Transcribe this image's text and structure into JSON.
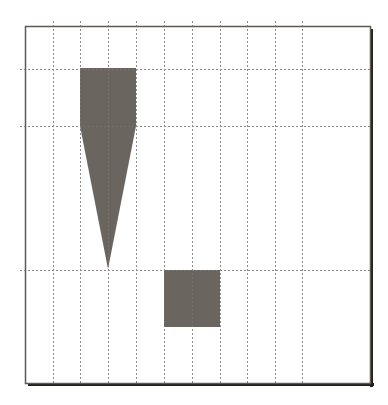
{
  "diagram": {
    "canvas": {
      "width": 388,
      "height": 405
    },
    "frame": {
      "x": 25,
      "y": 26,
      "width": 346,
      "height": 358,
      "stroke": "#5e5a50",
      "shadow_color": "#231f1c",
      "shadow_offset": 3
    },
    "grid": {
      "color": "#8a8a8a",
      "dash": "2,2",
      "vertical_x": [
        53,
        80,
        108,
        136,
        164,
        192,
        220,
        247,
        275,
        302
      ],
      "horizontal_y": [
        69,
        126,
        270
      ],
      "overhang": 5
    },
    "shapes": [
      {
        "id": "tapered-shape",
        "type": "polygon",
        "description": "rectangle tapering into a downward-pointing triangle",
        "points": [
          [
            80,
            68
          ],
          [
            136,
            68
          ],
          [
            136,
            126
          ],
          [
            108,
            269
          ],
          [
            80,
            126
          ]
        ],
        "fill": "#6b6560"
      },
      {
        "id": "square-shape",
        "type": "rect",
        "x": 164,
        "y": 270,
        "width": 56,
        "height": 57,
        "fill": "#6b6560"
      }
    ]
  }
}
